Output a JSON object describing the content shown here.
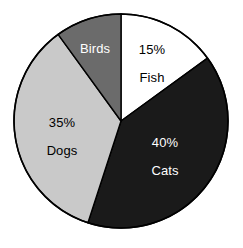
{
  "chart_data": {
    "type": "pie",
    "title": "",
    "subtitle": "",
    "xlabel": "",
    "ylabel": "",
    "legend_position": "none",
    "grid": false,
    "labels_inside_slices": true,
    "start_angle_deg": 0,
    "direction": "clockwise",
    "categories": [
      "Fish",
      "Cats",
      "Dogs",
      "Birds"
    ],
    "values": [
      15,
      40,
      35,
      10
    ],
    "value_unit": "%",
    "slices": [
      {
        "name": "Fish",
        "value": 15,
        "percent_label": "15%",
        "category_label": "Fish",
        "show_percent_label": true,
        "fill": "#ffffff",
        "text_color": "#000000",
        "start_deg": 0,
        "end_deg": 54,
        "percent_label_x": 152,
        "percent_label_y": 49,
        "category_label_x": 152,
        "category_label_y": 77
      },
      {
        "name": "Cats",
        "value": 40,
        "percent_label": "40%",
        "category_label": "Cats",
        "show_percent_label": true,
        "fill": "#1a1a1a",
        "text_color": "#ffffff",
        "start_deg": 54,
        "end_deg": 198,
        "percent_label_x": 165,
        "percent_label_y": 142,
        "category_label_x": 165,
        "category_label_y": 170
      },
      {
        "name": "Dogs",
        "value": 35,
        "percent_label": "35%",
        "category_label": "Dogs",
        "show_percent_label": true,
        "fill": "#c9c9c9",
        "text_color": "#000000",
        "start_deg": 198,
        "end_deg": 324,
        "percent_label_x": 62,
        "percent_label_y": 122,
        "category_label_x": 62,
        "category_label_y": 150
      },
      {
        "name": "Birds",
        "value": 10,
        "percent_label": "",
        "category_label": "Birds",
        "show_percent_label": false,
        "fill": "#6b6b6b",
        "text_color": "#ffffff",
        "start_deg": 324,
        "end_deg": 360,
        "percent_label_x": 0,
        "percent_label_y": 0,
        "category_label_x": 95,
        "category_label_y": 48
      }
    ],
    "geometry": {
      "center_x": 121,
      "center_y": 121,
      "radius": 107
    },
    "colors": {
      "fish": "#ffffff",
      "cats": "#1a1a1a",
      "dogs": "#c9c9c9",
      "birds": "#6b6b6b",
      "outline": "#000000",
      "background": "#ffffff"
    }
  }
}
